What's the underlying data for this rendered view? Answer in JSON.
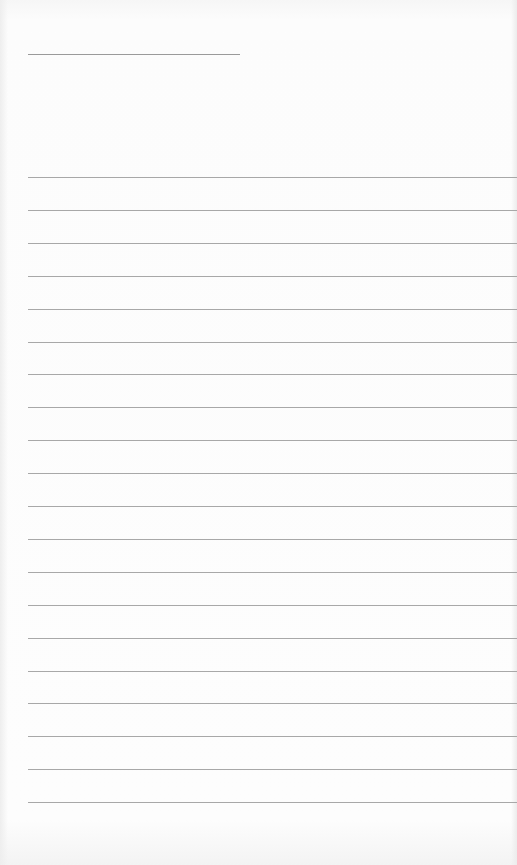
{
  "sheet": {
    "type": "lined-paper",
    "title_line": {
      "text": ""
    },
    "ruled_lines": [
      {
        "text": ""
      },
      {
        "text": ""
      },
      {
        "text": ""
      },
      {
        "text": ""
      },
      {
        "text": ""
      },
      {
        "text": ""
      },
      {
        "text": ""
      },
      {
        "text": ""
      },
      {
        "text": ""
      },
      {
        "text": ""
      },
      {
        "text": ""
      },
      {
        "text": ""
      },
      {
        "text": ""
      },
      {
        "text": ""
      },
      {
        "text": ""
      },
      {
        "text": ""
      },
      {
        "text": ""
      },
      {
        "text": ""
      },
      {
        "text": ""
      },
      {
        "text": ""
      }
    ],
    "colors": {
      "paper": "#fbfbfb",
      "line": "#a8a8a8"
    }
  }
}
